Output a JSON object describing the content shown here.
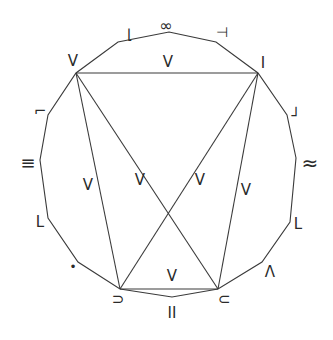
{
  "diagram": {
    "type": "polygon-graph",
    "outer_polygon": [
      [
        169,
        32
      ],
      [
        216,
        42
      ],
      [
        258,
        73
      ],
      [
        287,
        115
      ],
      [
        296,
        158
      ],
      [
        290,
        222
      ],
      [
        262,
        262
      ],
      [
        218,
        289
      ],
      [
        172,
        297
      ],
      [
        120,
        289
      ],
      [
        78,
        262
      ],
      [
        48,
        218
      ],
      [
        40,
        160
      ],
      [
        48,
        115
      ],
      [
        76,
        73
      ],
      [
        118,
        42
      ]
    ],
    "inner_edges": [
      {
        "from": [
          76,
          73
        ],
        "to": [
          258,
          73
        ],
        "label": "V",
        "label_pos": [
          168,
          62
        ]
      },
      {
        "from": [
          76,
          73
        ],
        "to": [
          120,
          289
        ],
        "label": "V",
        "label_pos": [
          88,
          185
        ]
      },
      {
        "from": [
          76,
          73
        ],
        "to": [
          218,
          289
        ],
        "label": "V",
        "label_pos": [
          140,
          180
        ]
      },
      {
        "from": [
          258,
          73
        ],
        "to": [
          120,
          289
        ],
        "label": "V",
        "label_pos": [
          200,
          180
        ]
      },
      {
        "from": [
          258,
          73
        ],
        "to": [
          218,
          289
        ],
        "label": "V",
        "label_pos": [
          246,
          190
        ]
      },
      {
        "from": [
          120,
          289
        ],
        "to": [
          218,
          289
        ],
        "label": "V",
        "label_pos": [
          172,
          276
        ]
      }
    ],
    "vertex_labels": [
      {
        "text": "∞",
        "x": 166,
        "y": 26,
        "size": 16
      },
      {
        "text": "⊣",
        "x": 222,
        "y": 33,
        "size": 14
      },
      {
        "text": "I",
        "x": 263,
        "y": 63,
        "size": 15
      },
      {
        "text": "┘",
        "x": 296,
        "y": 116,
        "size": 15
      },
      {
        "text": "≈",
        "x": 310,
        "y": 164,
        "size": 20
      },
      {
        "text": "L",
        "x": 298,
        "y": 224,
        "size": 15
      },
      {
        "text": "Λ",
        "x": 270,
        "y": 272,
        "size": 15
      },
      {
        "text": "⊂",
        "x": 224,
        "y": 299,
        "size": 15
      },
      {
        "text": "II",
        "x": 172,
        "y": 313,
        "size": 15
      },
      {
        "text": "⊃",
        "x": 118,
        "y": 299,
        "size": 15
      },
      {
        "text": "•",
        "x": 73,
        "y": 267,
        "size": 12
      },
      {
        "text": "L",
        "x": 40,
        "y": 222,
        "size": 15
      },
      {
        "text": "≡",
        "x": 28,
        "y": 164,
        "size": 18
      },
      {
        "text": "⌐",
        "x": 40,
        "y": 111,
        "size": 15
      },
      {
        "text": "V",
        "x": 73,
        "y": 61,
        "size": 15
      },
      {
        "text": "⌊",
        "x": 130,
        "y": 35,
        "size": 14
      }
    ]
  }
}
